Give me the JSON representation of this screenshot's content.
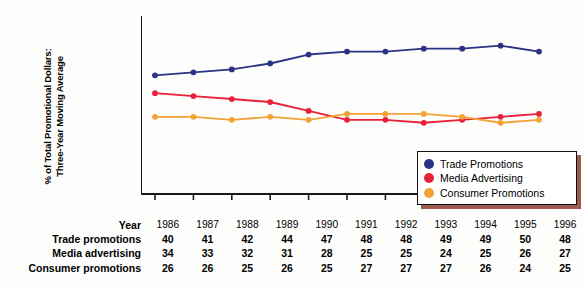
{
  "chart_data": {
    "type": "line",
    "title": "",
    "xlabel": "Year",
    "ylabel": "% of Total Promotional Dollars:\nThree-Year Moving Average",
    "ylim": [
      0,
      60
    ],
    "yticks": [
      0,
      10,
      20,
      30,
      40,
      50,
      60
    ],
    "grid": false,
    "legend_position": "bottom-right",
    "categories": [
      "1986",
      "1987",
      "1988",
      "1989",
      "1990",
      "1991",
      "1992",
      "1993",
      "1994",
      "1995",
      "1996"
    ],
    "series": [
      {
        "name": "Trade Promotions",
        "table_label": "Trade promotions",
        "color": "#2b3384",
        "values": [
          40,
          41,
          42,
          44,
          47,
          48,
          48,
          49,
          49,
          50,
          48
        ]
      },
      {
        "name": "Media Advertising",
        "table_label": "Media advertising",
        "color": "#e8203a",
        "values": [
          34,
          33,
          32,
          31,
          28,
          25,
          25,
          24,
          25,
          26,
          27
        ]
      },
      {
        "name": "Consumer Promotions",
        "table_label": "Consumer promotions",
        "color": "#f4a236",
        "values": [
          26,
          26,
          25,
          26,
          25,
          27,
          27,
          27,
          26,
          24,
          25
        ]
      }
    ]
  },
  "axis": {
    "y_title": "% of Total Promotional Dollars:\nThree-Year Moving Average",
    "y_ticks": [
      "60",
      "50",
      "40",
      "30",
      "20",
      "10",
      "0"
    ]
  },
  "legend": {
    "items": [
      {
        "label": "Trade Promotions",
        "color": "#2b3384"
      },
      {
        "label": "Media Advertising",
        "color": "#e8203a"
      },
      {
        "label": "Consumer Promotions",
        "color": "#f4a236"
      }
    ]
  },
  "table": {
    "year_header": "Year",
    "years": [
      "1986",
      "1987",
      "1988",
      "1989",
      "1990",
      "1991",
      "1992",
      "1993",
      "1994",
      "1995",
      "1996"
    ],
    "rows": [
      {
        "label": "Trade promotions",
        "values": [
          "40",
          "41",
          "42",
          "44",
          "47",
          "48",
          "48",
          "49",
          "49",
          "50",
          "48"
        ]
      },
      {
        "label": "Media advertising",
        "values": [
          "34",
          "33",
          "32",
          "31",
          "28",
          "25",
          "25",
          "24",
          "25",
          "26",
          "27"
        ]
      },
      {
        "label": "Consumer promotions",
        "values": [
          "26",
          "26",
          "25",
          "26",
          "25",
          "27",
          "27",
          "27",
          "26",
          "24",
          "25"
        ]
      }
    ]
  },
  "colors": {
    "trade": "#2b3384",
    "media": "#e8203a",
    "consumer": "#f4a236",
    "axis": "#1a1a1a",
    "legend_shadow": "#9e5a4e"
  }
}
